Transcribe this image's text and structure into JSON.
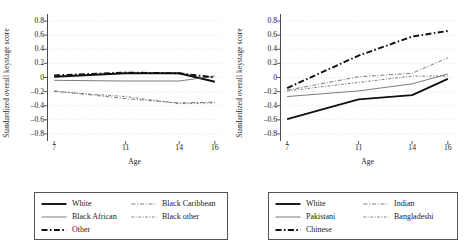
{
  "chart_data": [
    {
      "type": "line",
      "panel": "left",
      "title": "",
      "xlabel": "Age",
      "ylabel": "Standardized overall keystage score",
      "x": [
        7,
        11,
        14,
        16
      ],
      "xticks": [
        7,
        11,
        14,
        16
      ],
      "xlim": [
        6.6,
        16.4
      ],
      "ylim": [
        -0.9,
        0.9
      ],
      "yticks": [
        0.8,
        0.6,
        0.4,
        0.2,
        0,
        -0.2,
        -0.4,
        -0.6,
        -0.8
      ],
      "ytick_labels": [
        "0.8",
        "0.6",
        "0.4",
        "0.2",
        "0",
        "–0.2",
        "–0.4",
        "–0.6",
        "–0.8"
      ],
      "grid": "horizontal-dotted",
      "legend_position": "below",
      "series": [
        {
          "name": "White",
          "style": "solid-thick",
          "values": [
            0.01,
            0.06,
            0.06,
            -0.06
          ]
        },
        {
          "name": "Black African",
          "style": "solid-thin",
          "values": [
            -0.04,
            -0.05,
            -0.05,
            0.02
          ]
        },
        {
          "name": "Other",
          "style": "dashdot-thick",
          "values": [
            0.03,
            0.07,
            0.06,
            0.0
          ]
        },
        {
          "name": "Black Caribbean",
          "style": "dashdot-thin",
          "values": [
            -0.19,
            -0.3,
            -0.36,
            -0.35
          ]
        },
        {
          "name": "Black other",
          "style": "dashdot-thin2",
          "values": [
            -0.2,
            -0.27,
            -0.37,
            -0.36
          ]
        }
      ]
    },
    {
      "type": "line",
      "panel": "right",
      "title": "",
      "xlabel": "Age",
      "ylabel": "Standardized overall keystage score",
      "x": [
        7,
        11,
        14,
        16
      ],
      "xticks": [
        7,
        11,
        14,
        16
      ],
      "xlim": [
        6.6,
        16.4
      ],
      "ylim": [
        -0.9,
        0.9
      ],
      "yticks": [
        0.8,
        0.6,
        0.4,
        0.2,
        0,
        -0.2,
        -0.4,
        -0.6,
        -0.8
      ],
      "ytick_labels": [
        "0.8",
        "0.6",
        "0.4",
        "0.2",
        "0",
        "–0.2",
        "–0.4",
        "–0.6",
        "–0.8"
      ],
      "grid": "horizontal-dotted",
      "legend_position": "below",
      "series": [
        {
          "name": "White",
          "style": "solid-thick",
          "values": [
            -0.59,
            -0.31,
            -0.25,
            -0.02
          ]
        },
        {
          "name": "Pakistani",
          "style": "solid-thin",
          "values": [
            -0.27,
            -0.19,
            -0.09,
            0.05
          ]
        },
        {
          "name": "Chinese",
          "style": "dashdot-thick",
          "values": [
            -0.15,
            0.31,
            0.58,
            0.66
          ]
        },
        {
          "name": "Indian",
          "style": "dashdot-thin",
          "values": [
            -0.18,
            0.01,
            0.06,
            0.28
          ]
        },
        {
          "name": "Bangladeshi",
          "style": "dashdot-thin2",
          "values": [
            -0.19,
            -0.07,
            0.02,
            0.02
          ]
        }
      ]
    }
  ],
  "left_panel": {
    "ylabel": "Standardized overall keystage score",
    "xlabel": "Age",
    "yticks": [
      "0.8",
      "0.6",
      "0.4",
      "0.2",
      "0",
      "–0.2",
      "–0.4",
      "–0.6",
      "–0.8"
    ],
    "xticks": [
      "7",
      "11",
      "14",
      "16"
    ],
    "legend": [
      {
        "label": "White",
        "style": "solid-thick"
      },
      {
        "label": "Black Caribbean",
        "style": "dashdot-thin"
      },
      {
        "label": "Black African",
        "style": "solid-thin"
      },
      {
        "label": "Black other",
        "style": "dashdot-thin2"
      },
      {
        "label": "Other",
        "style": "dashdot-thick"
      }
    ]
  },
  "right_panel": {
    "ylabel": "Standardized overall keystage score",
    "xlabel": "Age",
    "yticks": [
      "0.8",
      "0.6",
      "0.4",
      "0.2",
      "0",
      "–0.2",
      "–0.4",
      "–0.6",
      "–0.8"
    ],
    "xticks": [
      "7",
      "11",
      "14",
      "16"
    ],
    "legend": [
      {
        "label": "White",
        "style": "solid-thick"
      },
      {
        "label": "Indian",
        "style": "dashdot-thin"
      },
      {
        "label": "Pakistani",
        "style": "solid-thin"
      },
      {
        "label": "Bangladeshi",
        "style": "dashdot-thin2"
      },
      {
        "label": "Chinese",
        "style": "dashdot-thick"
      }
    ]
  },
  "colors": {
    "line": "#101010",
    "line_light": "#5a5a5a",
    "axis": "#4a4a4a",
    "grid": "#c9c9c9",
    "background": "#ffffff"
  }
}
